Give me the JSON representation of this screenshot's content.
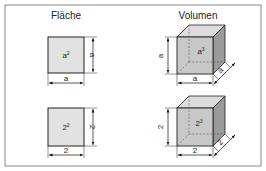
{
  "titles": {
    "area": "Fläche",
    "volume": "Volumen"
  },
  "rows": [
    {
      "square_label": "a",
      "square_label_sup": "2",
      "dim_width": "a",
      "dim_height": "a",
      "cube_label": "a",
      "cube_label_sup": "3",
      "cube_width": "a",
      "cube_height": "a",
      "cube_depth": "a"
    },
    {
      "square_label": "2",
      "square_label_sup": "2",
      "dim_width": "2",
      "dim_height": "2",
      "cube_label": "2",
      "cube_label_sup": "3",
      "cube_width": "2",
      "cube_height": "2",
      "cube_depth": "2"
    }
  ],
  "colors": {
    "face": "#c8c8c8",
    "side": "#9a9a9a",
    "top": "#dcdcdc",
    "square": "#e2e2e2",
    "frame": "#888888"
  }
}
